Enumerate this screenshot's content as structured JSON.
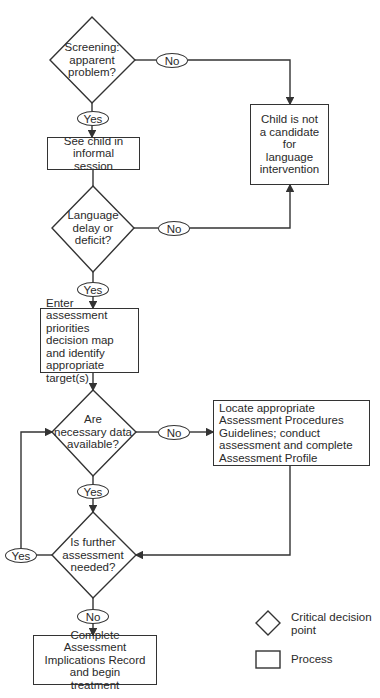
{
  "header": {
    "partial_title": "· · ·"
  },
  "flowchart": {
    "decisions": [
      {
        "id": "d1",
        "text": "Screening: apparent problem?"
      },
      {
        "id": "d2",
        "text": "Language delay or deficit?"
      },
      {
        "id": "d3",
        "text": "Are necessary data available?"
      },
      {
        "id": "d4",
        "text": "Is further assessment needed?"
      }
    ],
    "decision_lines": {
      "d1": [
        "Screening:",
        "apparent",
        "problem?"
      ],
      "d2": [
        "Language",
        "delay or",
        "deficit?"
      ],
      "d3": [
        "Are",
        "necessary data",
        "available?"
      ],
      "d4": [
        "Is further",
        "assessment",
        "needed?"
      ]
    },
    "processes": [
      {
        "id": "p1",
        "text": "See child in informal session"
      },
      {
        "id": "p2",
        "text": "Child is not a candidate for language intervention"
      },
      {
        "id": "p3",
        "text": "Enter assessment priorities decision map and identify appropriate target(s)"
      },
      {
        "id": "p4",
        "text": "Locate appropriate Assessment Procedures Guidelines; conduct assessment and complete Assessment Profile"
      },
      {
        "id": "p5",
        "text": "Complete Assessment Implications Record and begin treatment"
      }
    ],
    "edges": [
      {
        "from": "d1",
        "to": "p1",
        "label": "Yes"
      },
      {
        "from": "d1",
        "to": "p2",
        "label": "No"
      },
      {
        "from": "p1",
        "to": "d2",
        "label": ""
      },
      {
        "from": "d2",
        "to": "p3",
        "label": "Yes"
      },
      {
        "from": "d2",
        "to": "p2",
        "label": "No"
      },
      {
        "from": "p3",
        "to": "d3",
        "label": ""
      },
      {
        "from": "d3",
        "to": "d4",
        "label": "Yes"
      },
      {
        "from": "d3",
        "to": "p4",
        "label": "No"
      },
      {
        "from": "p4",
        "to": "d4",
        "label": ""
      },
      {
        "from": "d4",
        "to": "d3",
        "label": "Yes"
      },
      {
        "from": "d4",
        "to": "p5",
        "label": "No"
      }
    ],
    "labels": {
      "yes": "Yes",
      "no": "No"
    }
  },
  "legend": {
    "decision": "Critical decision point",
    "decision_lines": [
      "Critical decision",
      "point"
    ],
    "process": "Process"
  },
  "colors": {
    "line": "#333333",
    "text": "#2a2a2a",
    "background": "#ffffff"
  }
}
